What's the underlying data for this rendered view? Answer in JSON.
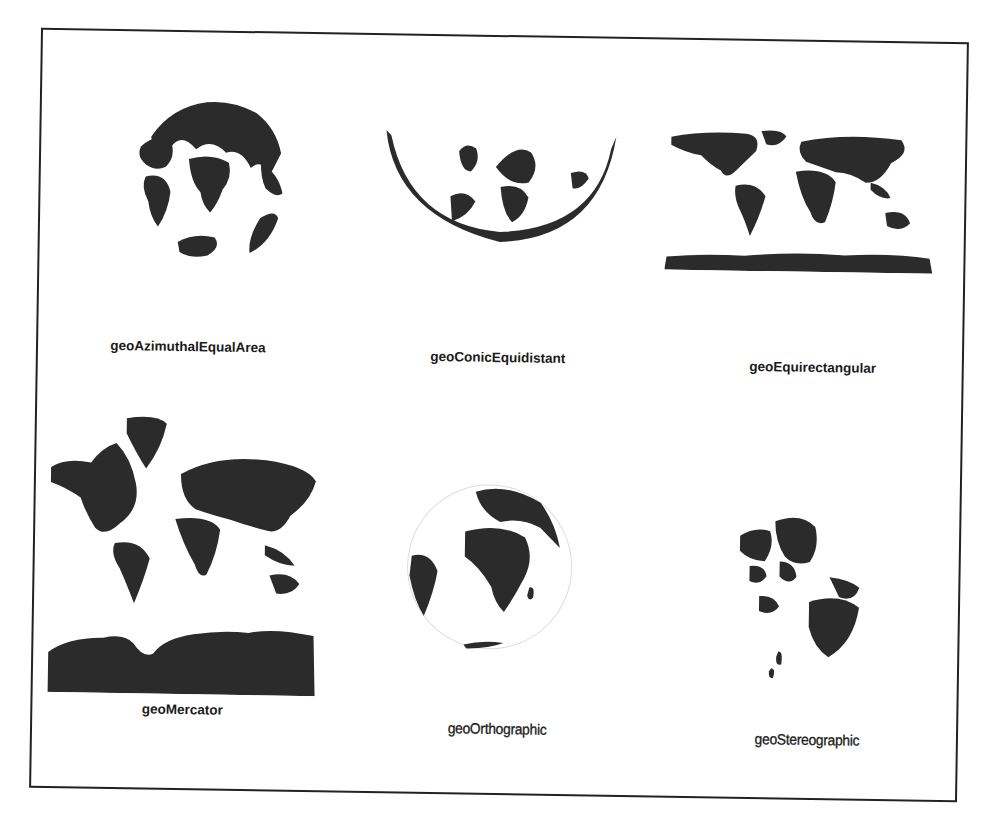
{
  "figure": {
    "title": "",
    "land_color": "#2b2b2b",
    "background_color": "#ffffff",
    "border_color": "#222222",
    "panels": [
      {
        "id": "azimuthal-equal-area",
        "label": "geoAzimuthalEqualArea",
        "row": 1,
        "col": 1
      },
      {
        "id": "conic-equidistant",
        "label": "geoConicEquidistant",
        "row": 1,
        "col": 2
      },
      {
        "id": "equirectangular",
        "label": "geoEquirectangular",
        "row": 1,
        "col": 3
      },
      {
        "id": "mercator",
        "label": "geoMercator",
        "row": 2,
        "col": 1
      },
      {
        "id": "orthographic",
        "label": "geoOrthographic",
        "row": 2,
        "col": 2
      },
      {
        "id": "stereographic",
        "label": "geoStereographic",
        "row": 2,
        "col": 3
      }
    ]
  }
}
